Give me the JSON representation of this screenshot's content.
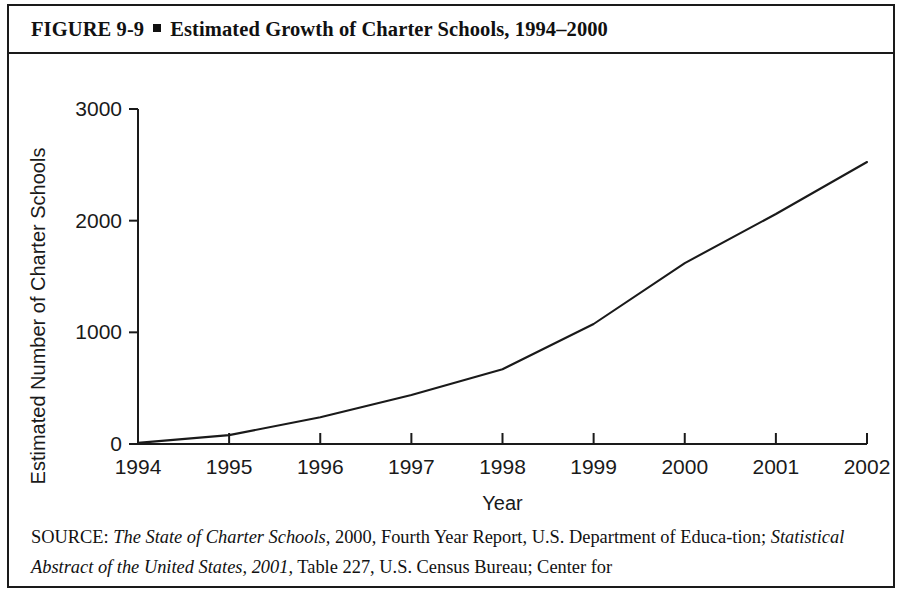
{
  "figure": {
    "number": "FIGURE  9-9",
    "bullet": "square-bullet",
    "title": "Estimated Growth of Charter Schools, 1994–2000"
  },
  "source": {
    "prefix": "SOURCE: ",
    "line1_italic_a": "The State of Charter Schools,",
    "line1_rest": " 2000, Fourth Year Report, U.S. Department of Educa-",
    "line2_lead": "tion; ",
    "line2_italic": "Statistical Abstract of the United States, 2001,",
    "line2_rest": " Table 227, U.S. Census Bureau; Center for"
  },
  "colors": {
    "line": "#1a1a1a",
    "axis": "#1a1a1a",
    "frame": "#1a1a1a",
    "background": "#ffffff"
  },
  "chart_data": {
    "type": "line",
    "title": "Estimated Growth of Charter Schools, 1994–2000",
    "xlabel": "Year",
    "ylabel": "Estimated Number of Charter Schools",
    "x": [
      1994,
      1995,
      1996,
      1997,
      1998,
      1999,
      2000,
      2001,
      2002
    ],
    "xticklabels": [
      "1994",
      "1995",
      "1996",
      "1997",
      "1998",
      "1999",
      "2000",
      "2001",
      "2002"
    ],
    "values": [
      10,
      80,
      240,
      440,
      670,
      1075,
      1620,
      2060,
      2525
    ],
    "yticks": [
      0,
      1000,
      2000,
      3000
    ],
    "yticklabels": [
      "0",
      "1000",
      "2000",
      "3000"
    ],
    "xlim": [
      1994,
      2002
    ],
    "ylim": [
      0,
      3000
    ],
    "grid": false,
    "legend": false,
    "series": [
      {
        "name": "Estimated Number of Charter Schools",
        "values": [
          10,
          80,
          240,
          440,
          670,
          1075,
          1620,
          2060,
          2525
        ]
      }
    ]
  }
}
